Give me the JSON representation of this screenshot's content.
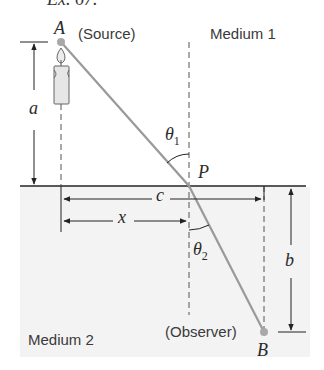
{
  "header": {
    "caption_fragment": "Ex. 67."
  },
  "labels": {
    "point_a": "A",
    "point_b": "B",
    "point_p": "P",
    "source": "(Source)",
    "observer": "(Observer)",
    "medium1": "Medium 1",
    "medium2": "Medium 2",
    "dim_a": "a",
    "dim_b": "b",
    "dim_c": "c",
    "dim_x": "x",
    "theta1": "θ",
    "theta1_sub": "1",
    "theta2": "θ",
    "theta2_sub": "2"
  },
  "icons": {
    "source_icon": "candle-icon"
  },
  "colors": {
    "ray": "#9a9a9a",
    "lines": "#222222",
    "medium2_fill": "#f3f3f3",
    "points": "#a8a8a8"
  }
}
